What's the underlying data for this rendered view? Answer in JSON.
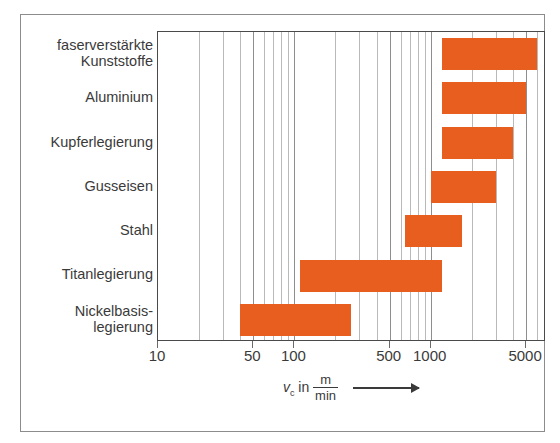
{
  "chart_data": {
    "type": "bar",
    "orientation": "horizontal",
    "title": "",
    "xlabel": "v_c in m/min",
    "ylabel": "",
    "xscale": "log",
    "xlim": [
      10,
      7000
    ],
    "grid": true,
    "legend": null,
    "bar_color": "#e75e1e",
    "categories": [
      "faserverstärkte\nKunststoffe",
      "Aluminium",
      "Kupferlegierung",
      "Gusseisen",
      "Stahl",
      "Titanlegierung",
      "Nickelbasis-\nlegierung"
    ],
    "ranges": [
      {
        "category": "faserverstärkte Kunststoffe",
        "min": 1200,
        "max": 6000
      },
      {
        "category": "Aluminium",
        "min": 1200,
        "max": 5000
      },
      {
        "category": "Kupferlegierung",
        "min": 1200,
        "max": 4000
      },
      {
        "category": "Gusseisen",
        "min": 1000,
        "max": 3000
      },
      {
        "category": "Stahl",
        "min": 650,
        "max": 1700
      },
      {
        "category": "Titanlegierung",
        "min": 110,
        "max": 1200
      },
      {
        "category": "Nickelbasislegierung",
        "min": 40,
        "max": 260
      }
    ],
    "xticks": [
      10,
      50,
      100,
      500,
      1000,
      5000
    ],
    "xticklabels": [
      "10",
      "50",
      "100",
      "500",
      "1000",
      "5000"
    ],
    "minor_gridlines": [
      20,
      30,
      40,
      50,
      60,
      70,
      80,
      90,
      100,
      200,
      300,
      400,
      500,
      600,
      700,
      800,
      900,
      1000,
      2000,
      3000,
      4000,
      5000,
      6000,
      7000
    ]
  },
  "axis_title": {
    "symbol": "v",
    "subscript": "c",
    "in": "in",
    "numerator": "m",
    "denominator": "min"
  }
}
